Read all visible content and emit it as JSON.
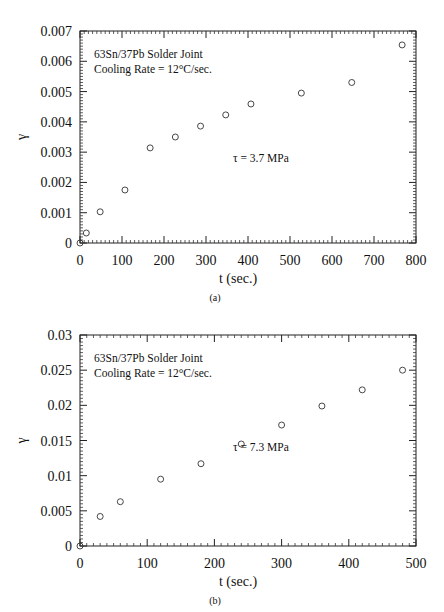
{
  "chart_data": [
    {
      "type": "scatter",
      "panel_label": "(a)",
      "title": "",
      "annotation_lines": [
        "63Sn/37Pb Solder Joint",
        "Cooling Rate = 12°C/sec."
      ],
      "stress_label": "τ = 3.7   MPa",
      "xlabel": "t  (sec.)",
      "ylabel": "γ",
      "xlim": [
        0,
        800
      ],
      "ylim": [
        0,
        0.007
      ],
      "xticks": [
        0,
        100,
        200,
        300,
        400,
        500,
        600,
        700,
        800
      ],
      "xtick_labels": [
        "0",
        "100",
        "200",
        "300",
        "400",
        "500",
        "600",
        "700",
        "800"
      ],
      "yticks": [
        0,
        0.001,
        0.002,
        0.003,
        0.004,
        0.005,
        0.006,
        0.007
      ],
      "ytick_labels": [
        "0",
        "0.001",
        "0.002",
        "0.003",
        "0.004",
        "0.005",
        "0.006",
        "0.007"
      ],
      "grid": false,
      "marker": "open-circle",
      "series": [
        {
          "name": "τ = 3.7 MPa",
          "x": [
            0,
            15,
            48,
            107,
            167,
            227,
            287,
            347,
            407,
            527,
            647,
            767
          ],
          "y": [
            0,
            0.00033,
            0.00103,
            0.00175,
            0.00314,
            0.0035,
            0.00386,
            0.00423,
            0.00459,
            0.00495,
            0.0053,
            0.00654
          ]
        }
      ]
    },
    {
      "type": "scatter",
      "panel_label": "(b)",
      "title": "",
      "annotation_lines": [
        "63Sn/37Pb Solder Joint",
        "Cooling Rate = 12°C/sec."
      ],
      "stress_label": "τ = 7.3   MPa",
      "xlabel": "t  (sec.)",
      "ylabel": "γ",
      "xlim": [
        0,
        500
      ],
      "ylim": [
        0,
        0.03
      ],
      "xticks": [
        0,
        100,
        200,
        300,
        400,
        500
      ],
      "xtick_labels": [
        "0",
        "100",
        "200",
        "300",
        "400",
        "500"
      ],
      "yticks": [
        0,
        0.005,
        0.01,
        0.015,
        0.02,
        0.025,
        0.03
      ],
      "ytick_labels": [
        "0",
        "0.005",
        "0.01",
        "0.015",
        "0.02",
        "0.025",
        "0.03"
      ],
      "grid": false,
      "marker": "open-circle",
      "series": [
        {
          "name": "τ = 7.3 MPa",
          "x": [
            0,
            30,
            60,
            120,
            180,
            240,
            300,
            360,
            420,
            480
          ],
          "y": [
            0,
            0.0042,
            0.0063,
            0.0095,
            0.0117,
            0.0145,
            0.0172,
            0.0199,
            0.0222,
            0.025
          ]
        }
      ]
    }
  ]
}
